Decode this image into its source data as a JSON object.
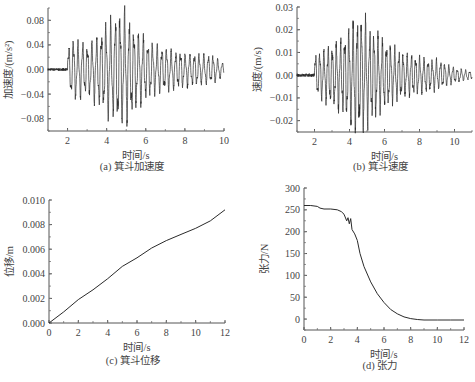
{
  "chart_data": [
    {
      "id": "a",
      "type": "line",
      "caption": "(a)  箕斗加速度",
      "xlabel": "时间/s",
      "ylabel": "加速度/(m/s²)",
      "xlim": [
        1,
        10
      ],
      "ylim": [
        -0.1,
        0.1
      ],
      "xticks": [
        2,
        4,
        6,
        8,
        10
      ],
      "xtick_labels": [
        "2",
        "4",
        "6",
        "8",
        "10"
      ],
      "yticks": [
        0.08,
        0.04,
        0.0,
        -0.04,
        -0.08
      ],
      "ytick_labels": [
        "0.08",
        "0.04",
        "0.00",
        "−0.04",
        "−0.08"
      ],
      "grid": false,
      "signal": {
        "kind": "oscillation",
        "start": 1.0,
        "end": 10.0,
        "onset": 2.0,
        "pre_noise": 0.002,
        "frequency_hz": 4.2,
        "envelope": [
          [
            2.0,
            0.03
          ],
          [
            2.3,
            0.045
          ],
          [
            3.0,
            0.035
          ],
          [
            4.0,
            0.065
          ],
          [
            4.6,
            0.08
          ],
          [
            4.9,
            0.085
          ],
          [
            5.5,
            0.055
          ],
          [
            6.5,
            0.035
          ],
          [
            8.0,
            0.025
          ],
          [
            9.5,
            0.02
          ],
          [
            10.0,
            0.008
          ]
        ]
      }
    },
    {
      "id": "b",
      "type": "line",
      "caption": "(b)  箕斗速度",
      "xlabel": "时间/s",
      "ylabel": "速度/(m/s)",
      "xlim": [
        1,
        11
      ],
      "ylim": [
        -0.025,
        0.03
      ],
      "xticks": [
        2,
        4,
        6,
        8,
        10
      ],
      "xtick_labels": [
        "2",
        "4",
        "6",
        "8",
        "10"
      ],
      "yticks": [
        0.03,
        0.02,
        0.01,
        0.0,
        -0.01,
        -0.02
      ],
      "ytick_labels": [
        "0.03",
        "0.02",
        "0.01",
        "0.00",
        "−0.01",
        "−0.02"
      ],
      "grid": false,
      "signal": {
        "kind": "oscillation",
        "start": 1.0,
        "end": 11.0,
        "onset": 2.0,
        "pre_noise": 0.0007,
        "frequency_hz": 4.2,
        "envelope": [
          [
            2.0,
            0.008
          ],
          [
            2.5,
            0.01
          ],
          [
            3.5,
            0.014
          ],
          [
            4.2,
            0.021
          ],
          [
            4.6,
            0.023
          ],
          [
            5.2,
            0.019
          ],
          [
            6.0,
            0.013
          ],
          [
            7.0,
            0.009
          ],
          [
            8.0,
            0.007
          ],
          [
            9.0,
            0.006
          ],
          [
            10.0,
            0.003
          ],
          [
            11.0,
            0.0015
          ]
        ]
      }
    },
    {
      "id": "c",
      "type": "line",
      "caption": "(c)  箕斗位移",
      "xlabel": "时间/s",
      "ylabel": "位移/m",
      "xlim": [
        0,
        12
      ],
      "ylim": [
        0,
        0.01
      ],
      "xticks": [
        0,
        2,
        4,
        6,
        8,
        10,
        12
      ],
      "xtick_labels": [
        "0",
        "2",
        "4",
        "6",
        "8",
        "10",
        "12"
      ],
      "yticks": [
        0.0,
        0.002,
        0.004,
        0.006,
        0.008,
        0.01
      ],
      "ytick_labels": [
        "0.000",
        "0.002",
        "0.004",
        "0.006",
        "0.008",
        "0.010"
      ],
      "grid": false,
      "x": [
        0,
        1,
        2,
        3,
        4,
        5,
        6,
        7,
        8,
        9,
        10,
        11,
        12
      ],
      "y": [
        0.0,
        0.0009,
        0.0019,
        0.0027,
        0.0036,
        0.0046,
        0.0053,
        0.0061,
        0.0067,
        0.0072,
        0.0077,
        0.0083,
        0.0092
      ]
    },
    {
      "id": "d",
      "type": "line",
      "caption": "(d)  张力",
      "xlabel": "时间/s",
      "ylabel": "张力/N",
      "xlim": [
        0,
        12
      ],
      "ylim": [
        -25,
        300
      ],
      "xticks": [
        0,
        2,
        4,
        6,
        8,
        10,
        12
      ],
      "xtick_labels": [
        "0",
        "2",
        "4",
        "6",
        "8",
        "10",
        "12"
      ],
      "yticks": [
        300,
        250,
        200,
        150,
        100,
        50,
        0
      ],
      "ytick_labels": [
        "300",
        "250",
        "200",
        "150",
        "100",
        "50",
        "0"
      ],
      "grid": false,
      "x": [
        0,
        0.5,
        1.0,
        1.2,
        1.5,
        2.0,
        2.5,
        2.8,
        3.0,
        3.2,
        3.3,
        3.4,
        3.5,
        3.6,
        3.8,
        4.0,
        4.2,
        4.5,
        5.0,
        5.5,
        6.0,
        6.5,
        7.0,
        7.5,
        8.0,
        8.5,
        9.0,
        10.0,
        11.0,
        12.0
      ],
      "y": [
        260,
        260,
        258,
        254,
        252,
        252,
        250,
        246,
        240,
        225,
        232,
        218,
        230,
        205,
        195,
        180,
        150,
        120,
        85,
        58,
        38,
        22,
        12,
        5,
        1,
        -1,
        -2,
        -2,
        -2,
        -2
      ]
    }
  ],
  "panels_layout": {
    "a": {
      "x0": 48,
      "x1": 224,
      "y0": 8,
      "y1": 131,
      "cap_y": 170
    },
    "b": {
      "x0": 297,
      "x1": 472,
      "y0": 7,
      "y1": 132,
      "cap_y": 170
    },
    "c": {
      "x0": 49,
      "x1": 225,
      "y0": 200,
      "y1": 323,
      "cap_y": 364
    },
    "d": {
      "x0": 304,
      "x1": 464,
      "y0": 188,
      "y1": 330,
      "cap_y": 369
    }
  }
}
